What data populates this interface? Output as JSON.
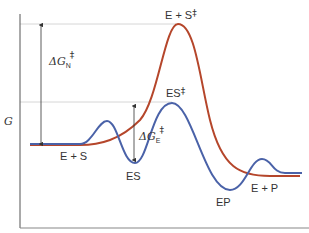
{
  "diagram": {
    "y_axis_label": "G",
    "colors": {
      "uncatalyzed": "#b5462b",
      "catalyzed": "#4a62a8",
      "axis": "#555555",
      "guide": "#cccccc",
      "text": "#333333"
    },
    "labels": {
      "reactants": "E + S",
      "uncat_transition": "E + S",
      "uncat_transition_mark": "‡",
      "es_transition": "ES",
      "es_transition_mark": "‡",
      "es_complex": "ES",
      "ep_complex": "EP",
      "products": "E + P",
      "delta_g_n_prefix": "ΔG",
      "delta_g_n_sub": "N",
      "delta_g_n_mark": "‡",
      "delta_g_e_prefix": "ΔG",
      "delta_g_e_sub": "E",
      "delta_g_e_mark": "‡"
    },
    "curves": [
      {
        "name": "uncatalyzed",
        "description": "Single high barrier from E + S to E + P"
      },
      {
        "name": "catalyzed",
        "description": "Multiple smaller barriers via ES and EP intermediates"
      }
    ]
  }
}
